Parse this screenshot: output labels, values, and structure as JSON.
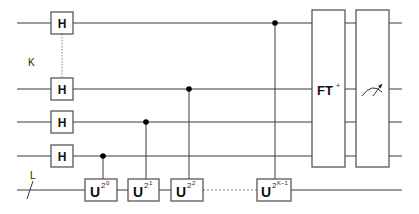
{
  "diagram": {
    "type": "quantum-circuit",
    "register_labels": {
      "control": "K",
      "target": "L"
    },
    "hadamard_label": "H",
    "controlled_unitaries": [
      {
        "base": "U",
        "exp": "2",
        "exp2": "0"
      },
      {
        "base": "U",
        "exp": "2",
        "exp2": "1"
      },
      {
        "base": "U",
        "exp": "2",
        "exp2": "2"
      },
      {
        "base": "U",
        "exp": "2",
        "exp2": "K−1"
      }
    ],
    "inverse_qft": {
      "label": "FT",
      "sup": "+"
    },
    "measurement": {
      "icon": "meter-icon"
    },
    "colors": {
      "wire": "#3a3a3a",
      "box_border": "#4a4a4a",
      "control_dot": "#000000",
      "background": "#ffffff"
    }
  }
}
